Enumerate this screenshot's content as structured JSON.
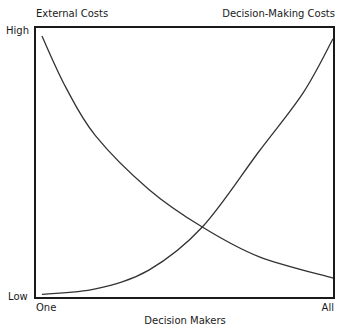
{
  "chart_data": {
    "type": "line",
    "title": "",
    "xlabel": "Decision Makers",
    "ylabel": "",
    "x_ticks": [
      "One",
      "All"
    ],
    "y_ticks": [
      "Low",
      "High"
    ],
    "legend": [],
    "annotations": [
      "External Costs",
      "Decision-Making Costs"
    ],
    "grid": false,
    "x_range": [
      0,
      1
    ],
    "y_range": [
      0,
      1
    ],
    "series": [
      {
        "name": "External Costs",
        "x": [
          0.02,
          0.1,
          0.2,
          0.38,
          0.56,
          0.75,
          1.0
        ],
        "values": [
          0.97,
          0.78,
          0.6,
          0.4,
          0.26,
          0.15,
          0.07
        ]
      },
      {
        "name": "Decision-Making Costs",
        "x": [
          0.02,
          0.2,
          0.38,
          0.56,
          0.75,
          0.9,
          1.0
        ],
        "values": [
          0.01,
          0.03,
          0.1,
          0.26,
          0.54,
          0.76,
          0.96
        ]
      }
    ]
  },
  "labels": {
    "top_left": "External Costs",
    "top_right": "Decision-Making Costs",
    "y_high": "High",
    "y_low": "Low",
    "x_start": "One",
    "x_end": "All",
    "x_axis": "Decision Makers"
  }
}
